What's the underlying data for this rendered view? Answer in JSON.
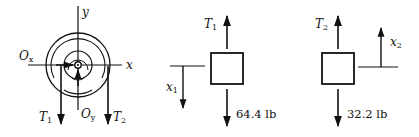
{
  "diagram": {
    "pulley": {
      "axis_x_label": "x",
      "axis_y_label": "y",
      "reaction_x": {
        "main": "O",
        "sub": "x"
      },
      "reaction_y": {
        "main": "O",
        "sub": "y"
      },
      "tension_left": {
        "main": "T",
        "sub": "1"
      },
      "tension_right": {
        "main": "T",
        "sub": "2"
      }
    },
    "block1": {
      "tension": {
        "main": "T",
        "sub": "1"
      },
      "weight": "64.4 lb",
      "coordinate": {
        "main": "x",
        "sub": "1"
      },
      "coordinate_direction": "down"
    },
    "block2": {
      "tension": {
        "main": "T",
        "sub": "2"
      },
      "weight": "32.2 lb",
      "coordinate": {
        "main": "x",
        "sub": "2"
      },
      "coordinate_direction": "up"
    },
    "colors": {
      "ink": "#111111",
      "background": "#ffffff"
    }
  }
}
